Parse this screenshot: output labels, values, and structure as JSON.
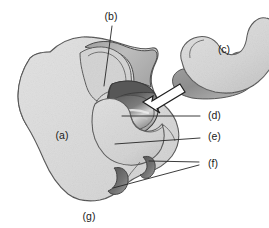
{
  "figure": {
    "background_color": "#ffffff",
    "width": 269,
    "height": 228,
    "line_color": "#4a4a4a",
    "label_color": "#1a1a1a"
  },
  "labels": [
    {
      "id": "a",
      "text": "(a)",
      "x": 62,
      "y": 136,
      "has_leader": false,
      "description": "large left body mass, light grey fill"
    },
    {
      "id": "b",
      "text": "(b)",
      "x": 111,
      "y": 17,
      "has_leader": true,
      "description": "upper ridge / fold, leader line descends to crest"
    },
    {
      "id": "c",
      "text": "(c)",
      "x": 224,
      "y": 50,
      "has_leader": false,
      "description": "separate kidney-shaped body at upper right"
    },
    {
      "id": "d",
      "text": "(d)",
      "x": 208,
      "y": 116,
      "has_leader": true,
      "description": "dark concave groove surface with highlight"
    },
    {
      "id": "e",
      "text": "(e)",
      "x": 208,
      "y": 137,
      "has_leader": true,
      "description": "light rounded lobe below the groove"
    },
    {
      "id": "f",
      "text": "(f)",
      "x": 208,
      "y": 164,
      "has_leader": true,
      "description": "two small dark crescent notches along lower border"
    },
    {
      "id": "g",
      "text": "(g)",
      "x": 89,
      "y": 217,
      "has_leader": false,
      "description": "lower border of the main body"
    }
  ],
  "shapes": {
    "main_body_fill": "#dcdcdc",
    "main_body_shade": "#c4c4c4",
    "rim_fill": "#b5b5b5",
    "groove_dark": "#4e4e4e",
    "groove_mid": "#6e6e6e",
    "groove_highlight": "#d8d8d8",
    "lobe_fill": "#d2d2d2",
    "right_body_fill": "#d5d5d5",
    "right_body_edge": "#9a9a9a",
    "notch_dark": "#5a5a5a",
    "arrow_fill": "#ffffff",
    "arrow_stroke": "#1f1f1f"
  },
  "arrow": {
    "name": "pointer-arrow",
    "direction": "down-left",
    "points_to": "d",
    "fill": "#ffffff",
    "stroke": "#1f1f1f"
  }
}
